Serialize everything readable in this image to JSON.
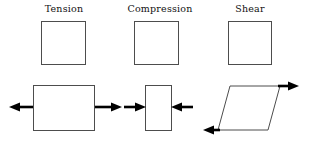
{
  "figure": {
    "width": 311,
    "height": 141,
    "background_color": "#ffffff",
    "outline_color": "#4d4d4d",
    "arrow_color": "#000000"
  },
  "columns": [
    {
      "id": "tension",
      "label": "Tension",
      "undeformed_shape": {
        "type": "square",
        "x": 41,
        "y": 21,
        "width": 45,
        "height": 44
      },
      "deformed_shape": {
        "type": "rectangle",
        "x": 33,
        "y": 85,
        "width": 62,
        "height": 46
      },
      "arrows": [
        {
          "name": "left-force-arrow",
          "direction": "left",
          "from_x": 33,
          "to_x": 10,
          "y": 107
        },
        {
          "name": "right-force-arrow",
          "direction": "right",
          "from_x": 95,
          "to_x": 122,
          "y": 107
        }
      ]
    },
    {
      "id": "compression",
      "label": "Compression",
      "undeformed_shape": {
        "type": "square",
        "x": 134,
        "y": 21,
        "width": 45,
        "height": 44
      },
      "deformed_shape": {
        "type": "rectangle",
        "x": 145,
        "y": 85,
        "width": 27,
        "height": 46
      },
      "arrows": [
        {
          "name": "left-force-arrow",
          "direction": "right",
          "from_x": 124,
          "to_x": 145,
          "y": 107
        },
        {
          "name": "right-force-arrow",
          "direction": "left",
          "from_x": 193,
          "to_x": 172,
          "y": 107
        }
      ]
    },
    {
      "id": "shear",
      "label": "Shear",
      "undeformed_shape": {
        "type": "square",
        "x": 228,
        "y": 21,
        "width": 44,
        "height": 44
      },
      "deformed_shape": {
        "type": "parallelogram",
        "points": "230,86 280,86 268,130 218,130"
      },
      "arrows": [
        {
          "name": "top-force-arrow",
          "direction": "right",
          "from_x": 280,
          "to_x": 299,
          "y": 86
        },
        {
          "name": "bottom-force-arrow",
          "direction": "left",
          "from_x": 218,
          "to_x": 204,
          "y": 130
        }
      ]
    }
  ]
}
